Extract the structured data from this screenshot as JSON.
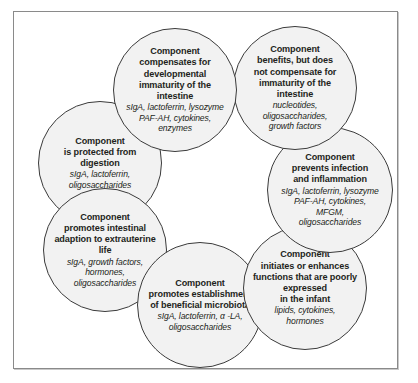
{
  "figure": {
    "frame_color": "#8a8a8a",
    "background_color": "#ffffff",
    "circle_fill": "#f2f2f2",
    "circle_stroke": "#3b3b3b",
    "text_color": "#231f20"
  },
  "nodes": [
    {
      "id": "compensates",
      "title": "Component\ncompensates for\ndevelopmental\nimmaturity of the\nintestine",
      "items": "sIgA, lactoferrin, lysozyme\nPAF-AH, cytokines,\nenzymes"
    },
    {
      "id": "benefits",
      "title": "Component\nbenefits, but does\nnot  compensate for\nimmaturity of the\nintestine",
      "items": "nucleotides,\noligosaccharides,\ngrowth factors"
    },
    {
      "id": "prevents",
      "title": "Component\nprevents infection\nand inflammation",
      "items": "sIgA, lactoferrin, lysozyme\nPAF-AH, cytokines,\nMFGM,\noligosaccharides"
    },
    {
      "id": "initiates",
      "title": "Component\ninitiates or enhances\nfunctions that are poorly\nexpressed\nin the infant",
      "items": "lipids, cytokines,\nhormones"
    },
    {
      "id": "microbiota",
      "title": "Component\npromotes establishment\nof beneficial microbiota",
      "items": "sIgA, lactoferrin, α -LA,\noligosaccharides"
    },
    {
      "id": "extrauterine",
      "title": "Component\npromotes intestinal\nadaption to extrauterine\nlife",
      "items": "sIgA, growth factors,\nhormones,\noligosaccharides"
    },
    {
      "id": "digestion",
      "title": "Component\nis protected from\ndigestion",
      "items": "sIgA, lactoferrin,\noligosaccharides"
    }
  ]
}
